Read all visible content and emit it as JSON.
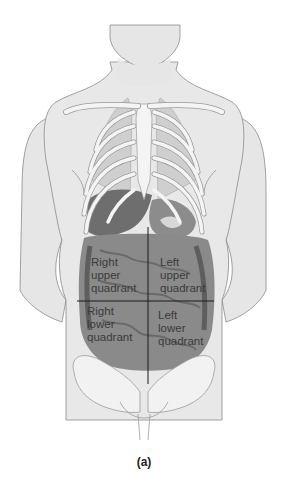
{
  "figure": {
    "caption": "(a)"
  },
  "quadrants": {
    "right_upper": {
      "line1": "Right",
      "line2": "upper",
      "line3": "quadrant"
    },
    "left_upper": {
      "line1": "Left",
      "line2": "upper",
      "line3": "quadrant"
    },
    "right_lower": {
      "line1": "Right",
      "line2": "lower",
      "line3": "quadrant"
    },
    "left_lower": {
      "line1": "Left",
      "line2": "lower",
      "line3": "quadrant"
    }
  },
  "colors": {
    "skin": "#e6e6e6",
    "outline": "#8a8a8a",
    "bone": "#f2f2f2",
    "organ_dark": "#6e6e6e",
    "organ_mid": "#8c8c8c",
    "divider": "#1a1a1a"
  }
}
